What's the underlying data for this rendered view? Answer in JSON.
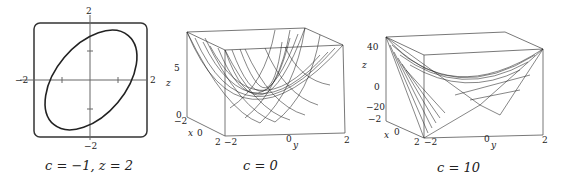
{
  "figure": {
    "panels": [
      {
        "id": "contour",
        "caption": "c = −1, z = 2",
        "type": "2d-level-curve",
        "description": "ellipse (level curve) in xy-plane",
        "axes": {
          "x_ticks": [
            "−2",
            "2"
          ],
          "y_ticks": [
            "2",
            "−2"
          ]
        }
      },
      {
        "id": "surface-c0",
        "caption": "c = 0",
        "type": "3d-wireframe-surface",
        "description": "paraboloid bowl",
        "axes": {
          "z_label": "z",
          "z_ticks": [
            "5",
            "0"
          ],
          "x_label": "x",
          "x_ticks": [
            "−2",
            "0",
            "2"
          ],
          "y_label": "y",
          "y_ticks": [
            "−2",
            "0",
            "2"
          ]
        }
      },
      {
        "id": "surface-c10",
        "caption": "c = 10",
        "type": "3d-wireframe-surface",
        "description": "saddle surface",
        "axes": {
          "z_label": "z",
          "z_ticks": [
            "40",
            "20",
            "0",
            "−20"
          ],
          "x_label": "x",
          "x_ticks": [
            "−2",
            "0",
            "2"
          ],
          "y_label": "y",
          "y_ticks": [
            "−2",
            "0",
            "2"
          ]
        }
      }
    ]
  }
}
